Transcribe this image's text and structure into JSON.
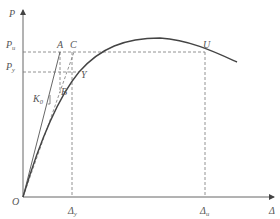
{
  "axes": {
    "y_label": "P",
    "x_label": "Δ",
    "origin_label": "O"
  },
  "y_ticks": [
    {
      "main": "P",
      "sub": "u",
      "y": 52
    },
    {
      "main": "P",
      "sub": "y",
      "y": 72
    }
  ],
  "x_ticks": [
    {
      "main": "Δ",
      "sub": "y",
      "x": 72
    },
    {
      "main": "Δ",
      "sub": "u",
      "x": 205
    }
  ],
  "points": {
    "A": "A",
    "C": "C",
    "Y": "Y",
    "B": "B",
    "U": "U"
  },
  "stiffness": {
    "main": "K",
    "sub": "0"
  },
  "colors": {
    "curve": "#444444",
    "axis": "#666666",
    "dashed": "#777777",
    "text": "#555555"
  }
}
